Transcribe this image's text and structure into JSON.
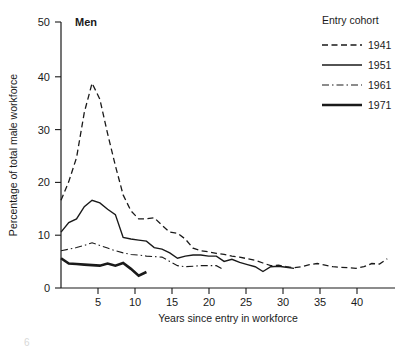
{
  "panel": {
    "label": "Men"
  },
  "legend": {
    "title": "Entry cohort",
    "position": "top-right",
    "entries": [
      {
        "label": "1941",
        "style": "dashed",
        "width": 1.3,
        "dash": "6,3.5"
      },
      {
        "label": "1951",
        "style": "solid",
        "width": 1.4,
        "dash": "none"
      },
      {
        "label": "1961",
        "style": "dashdot",
        "width": 1.1,
        "dash": "7,3,1.5,3"
      },
      {
        "label": "1971",
        "style": "solid",
        "width": 2.6,
        "dash": "none"
      }
    ]
  },
  "axes": {
    "x_label": "Years since entry in workforce",
    "y_label": "Percentage of total male workforce",
    "x_ticks": [
      "5",
      "10",
      "15",
      "20",
      "25",
      "30",
      "35",
      "40"
    ],
    "y_ticks": [
      "0",
      "10",
      "20",
      "30",
      "40",
      "50"
    ]
  },
  "colors": {
    "ink": "#1a1a1a",
    "background": "#ffffff"
  },
  "chart_data": {
    "type": "line",
    "title": "Men",
    "xlabel": "Years since entry in workforce",
    "ylabel": "Percentage of total male workforce",
    "xlim": [
      0,
      43
    ],
    "ylim": [
      0,
      50
    ],
    "xticks": [
      5,
      10,
      15,
      20,
      25,
      30,
      35,
      40
    ],
    "yticks": [
      0,
      10,
      20,
      30,
      40,
      50
    ],
    "grid": false,
    "legend_title": "Entry cohort",
    "legend_position": "top-right",
    "series": [
      {
        "name": "1941",
        "style": "dashed",
        "x": [
          0,
          1,
          2,
          3,
          4,
          5,
          6,
          7,
          8,
          9,
          10,
          11,
          12,
          13,
          14,
          15,
          16,
          17,
          18,
          19,
          20,
          21,
          22,
          23,
          24,
          25,
          26,
          27,
          28,
          29,
          30,
          31,
          32,
          33,
          34,
          35,
          36,
          37,
          38,
          39,
          40,
          41,
          42
        ],
        "y": [
          16.5,
          20.0,
          24.5,
          33.0,
          38.5,
          35.5,
          29.0,
          23.0,
          17.5,
          14.5,
          13.0,
          13.0,
          13.2,
          11.8,
          10.5,
          10.3,
          9.2,
          7.5,
          7.0,
          6.8,
          6.5,
          6.3,
          6.0,
          5.8,
          5.5,
          5.2,
          4.7,
          4.2,
          4.3,
          4.0,
          3.8,
          4.0,
          4.4,
          4.6,
          4.3,
          4.0,
          3.9,
          3.8,
          3.7,
          4.0,
          4.6,
          4.5,
          5.5
        ]
      },
      {
        "name": "1951",
        "style": "solid",
        "x": [
          0,
          1,
          2,
          3,
          4,
          5,
          6,
          7,
          8,
          9,
          10,
          11,
          12,
          13,
          14,
          15,
          16,
          17,
          18,
          19,
          20,
          21,
          22,
          23,
          24,
          25,
          26,
          27,
          28,
          29,
          30
        ],
        "y": [
          10.5,
          12.3,
          13.0,
          15.3,
          16.5,
          16.0,
          14.8,
          13.8,
          9.5,
          9.2,
          9.0,
          8.8,
          7.6,
          7.3,
          6.6,
          5.6,
          6.0,
          6.2,
          6.2,
          6.0,
          6.0,
          5.0,
          5.4,
          4.8,
          4.4,
          4.0,
          3.1,
          4.0,
          4.1,
          3.9,
          3.7
        ]
      },
      {
        "name": "1961",
        "style": "dashdot",
        "x": [
          0,
          1,
          2,
          3,
          4,
          5,
          6,
          7,
          8,
          9,
          10,
          11,
          12,
          13,
          14,
          15,
          16,
          17,
          18,
          19,
          20,
          21
        ],
        "y": [
          7.0,
          7.3,
          7.6,
          8.0,
          8.5,
          8.0,
          7.5,
          7.0,
          6.6,
          6.3,
          6.2,
          6.0,
          5.9,
          5.8,
          5.0,
          4.2,
          4.0,
          4.1,
          4.2,
          4.2,
          4.2,
          3.4
        ]
      },
      {
        "name": "1971",
        "style": "solid-thick",
        "x": [
          0,
          1,
          2,
          3,
          4,
          5,
          6,
          7,
          8,
          9,
          10,
          11
        ],
        "y": [
          5.6,
          4.6,
          4.5,
          4.4,
          4.3,
          4.2,
          4.6,
          4.2,
          4.7,
          3.6,
          2.3,
          3.0
        ]
      }
    ]
  }
}
